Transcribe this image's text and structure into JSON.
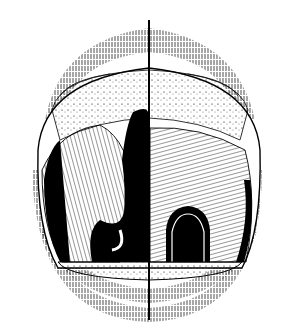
{
  "figure": {
    "background_color": "#ffffff",
    "ink_color": "#000000",
    "midline": {
      "x": 149,
      "y_start": 20,
      "y_end": 320
    }
  }
}
